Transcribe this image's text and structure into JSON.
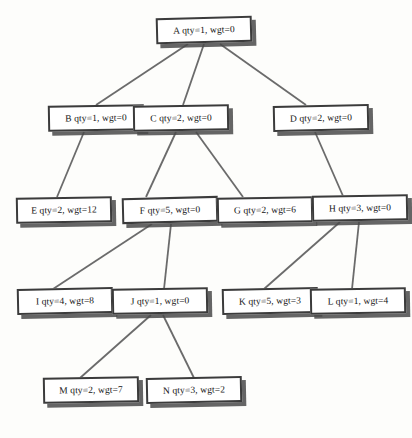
{
  "diagram": {
    "background_color": "#fdfdfb",
    "node_fill": "#ffffff",
    "node_border": "#3b3b3b",
    "shadow_color": "#4a4a4a",
    "edge_color": "#6b6b6b"
  },
  "nodes": [
    {
      "id": "A",
      "label": "A  qty=1, wgt=0",
      "qty": 1,
      "wgt": 0,
      "x": 156,
      "y": 17,
      "w": 96,
      "h": 26,
      "rot": -1.5
    },
    {
      "id": "B",
      "label": "B  qty=1, wgt=0",
      "qty": 1,
      "wgt": 0,
      "x": 48,
      "y": 105,
      "w": 96,
      "h": 26,
      "rot": -1.0
    },
    {
      "id": "C",
      "label": "C  qty=2, wgt=0",
      "qty": 2,
      "wgt": 0,
      "x": 133,
      "y": 105,
      "w": 96,
      "h": 26,
      "rot": -0.8
    },
    {
      "id": "D",
      "label": "D  qty=2, wgt=0",
      "qty": 2,
      "wgt": 0,
      "x": 273,
      "y": 105,
      "w": 96,
      "h": 26,
      "rot": -1.2
    },
    {
      "id": "E",
      "label": "E  qty=2, wgt=12",
      "qty": 2,
      "wgt": 12,
      "x": 16,
      "y": 197,
      "w": 96,
      "h": 26,
      "rot": -1.0
    },
    {
      "id": "F",
      "label": "F  qty=5, wgt=0",
      "qty": 5,
      "wgt": 0,
      "x": 122,
      "y": 197,
      "w": 96,
      "h": 26,
      "rot": -1.4
    },
    {
      "id": "G",
      "label": "G  qty=2, wgt=6",
      "qty": 2,
      "wgt": 6,
      "x": 217,
      "y": 197,
      "w": 96,
      "h": 26,
      "rot": -1.0
    },
    {
      "id": "H",
      "label": "H  qty=3, wgt=0",
      "qty": 3,
      "wgt": 0,
      "x": 312,
      "y": 195,
      "w": 96,
      "h": 26,
      "rot": -1.0
    },
    {
      "id": "I",
      "label": "I  qty=4, wgt=8",
      "qty": 4,
      "wgt": 8,
      "x": 17,
      "y": 288,
      "w": 96,
      "h": 26,
      "rot": -1.2
    },
    {
      "id": "J",
      "label": "J  qty=1, wgt=0",
      "qty": 1,
      "wgt": 0,
      "x": 112,
      "y": 288,
      "w": 96,
      "h": 26,
      "rot": -1.0
    },
    {
      "id": "K",
      "label": "K  qty=5, wgt=3",
      "qty": 5,
      "wgt": 3,
      "x": 222,
      "y": 288,
      "w": 96,
      "h": 26,
      "rot": -1.3
    },
    {
      "id": "L",
      "label": "L  qty=1, wgt=4",
      "qty": 1,
      "wgt": 4,
      "x": 310,
      "y": 288,
      "w": 96,
      "h": 26,
      "rot": -1.0
    },
    {
      "id": "M",
      "label": "M  qty=2, wgt=7",
      "qty": 2,
      "wgt": 7,
      "x": 43,
      "y": 377,
      "w": 96,
      "h": 26,
      "rot": -1.0
    },
    {
      "id": "N",
      "label": "N  qty=3, wgt=2",
      "qty": 3,
      "wgt": 2,
      "x": 146,
      "y": 377,
      "w": 96,
      "h": 26,
      "rot": -1.2
    }
  ],
  "edges": [
    {
      "from": "A",
      "to": "B",
      "x1": 188,
      "y1": 44,
      "x2": 96,
      "y2": 105
    },
    {
      "from": "A",
      "to": "C",
      "x1": 204,
      "y1": 44,
      "x2": 183,
      "y2": 105
    },
    {
      "from": "A",
      "to": "D",
      "x1": 220,
      "y1": 44,
      "x2": 306,
      "y2": 105
    },
    {
      "from": "B",
      "to": "E",
      "x1": 84,
      "y1": 132,
      "x2": 57,
      "y2": 197
    },
    {
      "from": "C",
      "to": "F",
      "x1": 176,
      "y1": 132,
      "x2": 146,
      "y2": 197
    },
    {
      "from": "C",
      "to": "G",
      "x1": 196,
      "y1": 132,
      "x2": 243,
      "y2": 197
    },
    {
      "from": "D",
      "to": "H",
      "x1": 315,
      "y1": 132,
      "x2": 343,
      "y2": 196
    },
    {
      "from": "F",
      "to": "I",
      "x1": 152,
      "y1": 224,
      "x2": 53,
      "y2": 289
    },
    {
      "from": "F",
      "to": "J",
      "x1": 171,
      "y1": 224,
      "x2": 164,
      "y2": 289
    },
    {
      "from": "H",
      "to": "K",
      "x1": 340,
      "y1": 222,
      "x2": 264,
      "y2": 289
    },
    {
      "from": "H",
      "to": "L",
      "x1": 359,
      "y1": 222,
      "x2": 352,
      "y2": 289
    },
    {
      "from": "J",
      "to": "M",
      "x1": 151,
      "y1": 315,
      "x2": 80,
      "y2": 378
    },
    {
      "from": "J",
      "to": "N",
      "x1": 163,
      "y1": 315,
      "x2": 194,
      "y2": 378
    }
  ]
}
